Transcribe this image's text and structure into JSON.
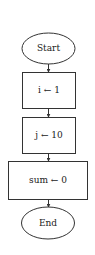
{
  "diagram": {
    "type": "flowchart",
    "colors": {
      "stroke": "#333333",
      "fill": "#ffffff",
      "text": "#1a1a1a"
    },
    "nodes": [
      {
        "id": "start",
        "shape": "terminator",
        "label": "Start"
      },
      {
        "id": "assign-i",
        "shape": "process",
        "label": "i ← 1"
      },
      {
        "id": "assign-j",
        "shape": "process",
        "label": "j ← 10"
      },
      {
        "id": "assign-sum",
        "shape": "process",
        "label": "sum ← 0"
      },
      {
        "id": "end",
        "shape": "terminator",
        "label": "End"
      }
    ],
    "edges": [
      {
        "from": "start",
        "to": "assign-i"
      },
      {
        "from": "assign-i",
        "to": "assign-j"
      },
      {
        "from": "assign-j",
        "to": "assign-sum"
      },
      {
        "from": "assign-sum",
        "to": "end"
      }
    ]
  }
}
